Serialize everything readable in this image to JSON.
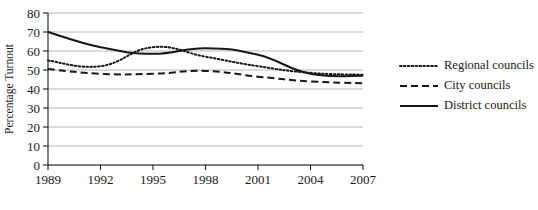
{
  "chart_data": {
    "type": "line",
    "title": "",
    "xlabel": "",
    "ylabel": "Percentage Turnout",
    "x": [
      "1989",
      "1992",
      "1995",
      "1998",
      "2001",
      "2004",
      "2007"
    ],
    "categories": [
      "1989",
      "1992",
      "1995",
      "1998",
      "2001",
      "2004",
      "2007"
    ],
    "ylim": [
      0,
      80
    ],
    "xlim": [
      "1989",
      "2007"
    ],
    "yticks": [
      "0",
      "10",
      "20",
      "30",
      "40",
      "50",
      "60",
      "70",
      "80"
    ],
    "ytick_values": [
      0,
      10,
      20,
      30,
      40,
      50,
      60,
      70,
      80
    ],
    "grid": "horizontal",
    "legend_position": "right",
    "series": [
      {
        "name": "Regional councils",
        "style": "dotted",
        "color": "#171717",
        "values": [
          55,
          52,
          62,
          57,
          52,
          48.5,
          47.5
        ]
      },
      {
        "name": "City councils",
        "style": "dashed",
        "color": "#171717",
        "values": [
          50.5,
          48,
          48,
          49.5,
          46.5,
          44,
          43
        ]
      },
      {
        "name": "District councils",
        "style": "solid",
        "color": "#171717",
        "values": [
          70,
          62,
          58.5,
          61.5,
          58,
          48,
          47
        ]
      }
    ]
  },
  "axes": {
    "y_axis_title": "Percentage Turnout"
  },
  "legend": {
    "entries": [
      {
        "label": "Regional councils",
        "style": "dotted"
      },
      {
        "label": "City councils",
        "style": "dashed"
      },
      {
        "label": "District councils",
        "style": "solid"
      }
    ]
  },
  "colors": {
    "ink": "#171717",
    "grid": "#9a9a9a",
    "background": "#ffffff"
  }
}
